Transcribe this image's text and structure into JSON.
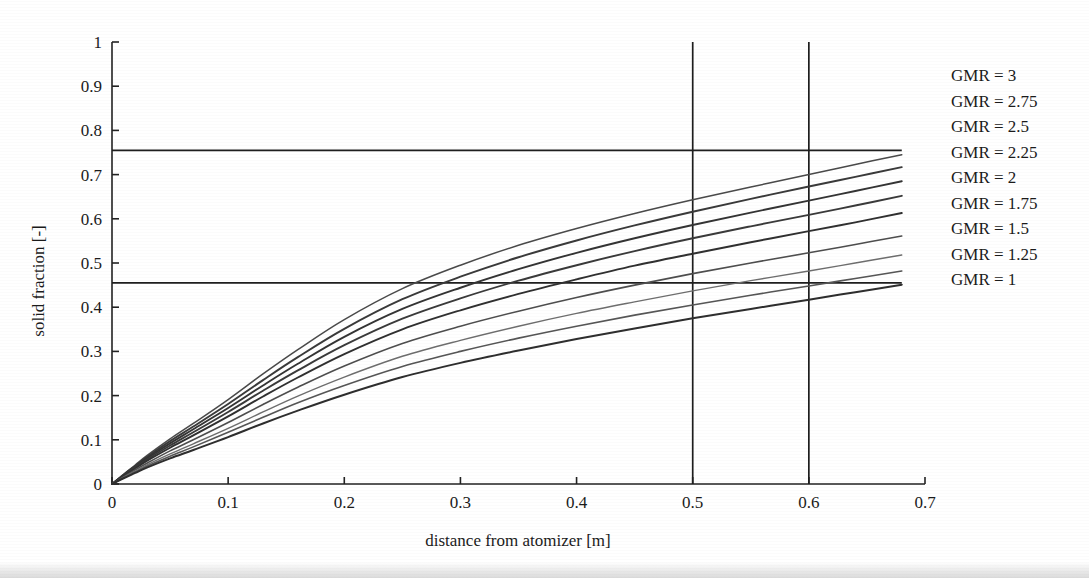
{
  "chart_data": {
    "type": "line",
    "title": "",
    "xlabel": "distance from atomizer [m]",
    "ylabel": "solid fraction [-]",
    "xlim": [
      0,
      0.7
    ],
    "ylim": [
      0,
      1
    ],
    "xticks": [
      "0",
      "0.1",
      "0.2",
      "0.3",
      "0.4",
      "0.5",
      "0.6",
      "0.7"
    ],
    "xtick_values": [
      0,
      0.1,
      0.2,
      0.3,
      0.4,
      0.5,
      0.6,
      0.7
    ],
    "yticks": [
      "0",
      "0.1",
      "0.2",
      "0.3",
      "0.4",
      "0.5",
      "0.6",
      "0.7",
      "0.8",
      "0.9",
      "1"
    ],
    "ytick_values": [
      0,
      0.1,
      0.2,
      0.3,
      0.4,
      0.5,
      0.6,
      0.7,
      0.8,
      0.9,
      1
    ],
    "grid": false,
    "legend_position": "right-outside",
    "line_color": "#2b2b2b",
    "x": [
      0,
      0.01,
      0.02,
      0.03,
      0.05,
      0.07,
      0.1,
      0.13,
      0.16,
      0.2,
      0.25,
      0.3,
      0.35,
      0.4,
      0.45,
      0.5,
      0.55,
      0.6,
      0.64,
      0.68
    ],
    "series": [
      {
        "name": "GMR = 3",
        "label": "GMR = 3",
        "values": [
          0,
          0.022,
          0.043,
          0.064,
          0.102,
          0.137,
          0.191,
          0.249,
          0.304,
          0.372,
          0.442,
          0.495,
          0.54,
          0.578,
          0.612,
          0.643,
          0.672,
          0.7,
          0.723,
          0.745
        ]
      },
      {
        "name": "GMR = 2.75",
        "label": "GMR = 2.75",
        "values": [
          0,
          0.021,
          0.041,
          0.061,
          0.097,
          0.13,
          0.181,
          0.235,
          0.287,
          0.351,
          0.418,
          0.469,
          0.513,
          0.551,
          0.585,
          0.616,
          0.645,
          0.673,
          0.695,
          0.717
        ]
      },
      {
        "name": "GMR = 2.5",
        "label": "GMR = 2.5",
        "values": [
          0,
          0.02,
          0.039,
          0.058,
          0.092,
          0.124,
          0.172,
          0.223,
          0.272,
          0.333,
          0.396,
          0.444,
          0.486,
          0.523,
          0.556,
          0.586,
          0.614,
          0.641,
          0.663,
          0.685
        ]
      },
      {
        "name": "GMR = 2.25",
        "label": "GMR = 2.25",
        "values": [
          0,
          0.019,
          0.037,
          0.055,
          0.087,
          0.117,
          0.163,
          0.211,
          0.257,
          0.314,
          0.374,
          0.42,
          0.46,
          0.495,
          0.527,
          0.556,
          0.583,
          0.609,
          0.63,
          0.652
        ]
      },
      {
        "name": "GMR = 2",
        "label": "GMR = 2",
        "values": [
          0,
          0.018,
          0.035,
          0.052,
          0.082,
          0.11,
          0.153,
          0.198,
          0.241,
          0.294,
          0.35,
          0.393,
          0.43,
          0.463,
          0.494,
          0.521,
          0.547,
          0.572,
          0.592,
          0.613
        ]
      },
      {
        "name": "GMR = 1.75",
        "label": "GMR = 1.75",
        "values": [
          0,
          0.016,
          0.032,
          0.047,
          0.075,
          0.1,
          0.139,
          0.18,
          0.219,
          0.267,
          0.318,
          0.357,
          0.391,
          0.422,
          0.45,
          0.476,
          0.5,
          0.523,
          0.542,
          0.561
        ]
      },
      {
        "name": "GMR = 1.5",
        "label": "GMR = 1.5",
        "values": [
          0,
          0.015,
          0.029,
          0.043,
          0.068,
          0.091,
          0.126,
          0.163,
          0.199,
          0.242,
          0.289,
          0.325,
          0.357,
          0.386,
          0.412,
          0.437,
          0.46,
          0.482,
          0.5,
          0.518
        ]
      },
      {
        "name": "GMR = 1.25",
        "label": "GMR = 1.25",
        "values": [
          0,
          0.014,
          0.027,
          0.04,
          0.063,
          0.084,
          0.117,
          0.151,
          0.184,
          0.223,
          0.266,
          0.3,
          0.33,
          0.357,
          0.382,
          0.405,
          0.427,
          0.448,
          0.465,
          0.482
        ]
      },
      {
        "name": "GMR = 1",
        "label": "GMR = 1",
        "values": [
          0,
          0.013,
          0.025,
          0.037,
          0.058,
          0.077,
          0.106,
          0.137,
          0.166,
          0.202,
          0.242,
          0.274,
          0.302,
          0.328,
          0.352,
          0.375,
          0.396,
          0.417,
          0.434,
          0.451
        ]
      }
    ],
    "reference_lines": [
      {
        "name": "upper-horizontal-reference",
        "orientation": "horizontal",
        "value": 0.755,
        "x_from": 0,
        "x_to": 0.68
      },
      {
        "name": "lower-horizontal-reference",
        "orientation": "horizontal",
        "value": 0.455,
        "x_from": 0,
        "x_to": 0.68
      },
      {
        "name": "vertical-reference-0.5",
        "orientation": "vertical",
        "value": 0.5,
        "y_from": 0,
        "y_to": 1
      },
      {
        "name": "vertical-reference-0.6",
        "orientation": "vertical",
        "value": 0.6,
        "y_from": 0,
        "y_to": 1
      }
    ]
  },
  "legend": {
    "items": [
      {
        "label": "GMR = 3"
      },
      {
        "label": "GMR = 2.75"
      },
      {
        "label": "GMR = 2.5"
      },
      {
        "label": "GMR = 2.25"
      },
      {
        "label": "GMR = 2"
      },
      {
        "label": "GMR = 1.75"
      },
      {
        "label": "GMR = 1.5"
      },
      {
        "label": "GMR = 1.25"
      },
      {
        "label": "GMR = 1"
      }
    ]
  },
  "axes": {
    "x_title": "distance from atomizer [m]",
    "y_title": "solid fraction [-]"
  }
}
